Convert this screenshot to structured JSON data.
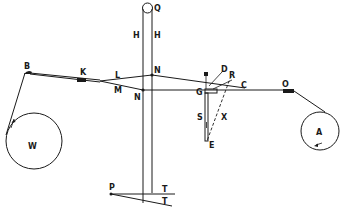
{
  "diagram": {
    "colors": {
      "ink": "#1a1a1a",
      "background": "#ffffff"
    },
    "labels": {
      "Q": "Q",
      "H_left": "H",
      "H_right": "H",
      "B": "B",
      "K": "K",
      "L": "L",
      "M": "M",
      "N_upper": "N",
      "N_lower": "N",
      "D": "D",
      "R": "R",
      "C": "C",
      "G": "G",
      "O": "O",
      "S": "S",
      "X": "X",
      "E": "E",
      "W": "W",
      "A": "A",
      "P": "P",
      "T_upper": "T",
      "T_lower": "T"
    }
  }
}
